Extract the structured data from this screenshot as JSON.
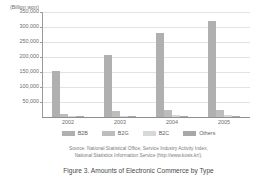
{
  "chart_data": {
    "type": "bar",
    "title": "",
    "unit_label": "(Billion won)",
    "xlabel": "",
    "ylabel": "",
    "categories": [
      "2002",
      "2003",
      "2004",
      "2005"
    ],
    "ylim": [
      0,
      350000
    ],
    "ytick_labels": [
      "350,000",
      "300,000",
      "250,000",
      "200,000",
      "150,000",
      "100,000",
      "50,000"
    ],
    "ytick_values": [
      350000,
      300000,
      250000,
      200000,
      150000,
      100000,
      50000
    ],
    "grid": true,
    "legend_position": "bottom",
    "series": [
      {
        "name": "B2B",
        "color": "#b0b0b0",
        "values": [
          154000,
          206000,
          280000,
          320000
        ]
      },
      {
        "name": "B2G",
        "color": "#bdbdbd",
        "values": [
          11000,
          19000,
          23000,
          25000
        ]
      },
      {
        "name": "B2C",
        "color": "#d8d8d8",
        "values": [
          4000,
          5000,
          6000,
          7000
        ]
      },
      {
        "name": "Others",
        "color": "#a8a8a8",
        "values": [
          1500,
          2000,
          2500,
          3000
        ]
      }
    ]
  },
  "source": {
    "line1": "Source: National Statistical Office, Service Industry Activity Index,",
    "line2": "National Statistics Information Service (http://www.kosis.kr/)."
  },
  "caption": {
    "text": "Figure 3. Amounts of Electronic Commerce by Type"
  }
}
